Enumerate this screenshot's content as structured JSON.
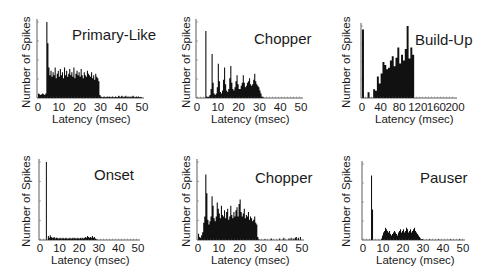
{
  "figure": {
    "ylabel": "Number of Spikes",
    "xlabel": "Latency (msec)"
  },
  "chart_data": [
    {
      "type": "bar",
      "title": "Primary-Like",
      "xlabel": "Latency (msec)",
      "ylabel": "Number of Spikes",
      "xlim": [
        0,
        50
      ],
      "xticks": [
        "0",
        "10",
        "20",
        "30",
        "40",
        "50"
      ],
      "bin_ms": 0.5,
      "description": "Sharp onset peak at ~4 ms followed by sustained irregular activity until ~29 ms, near-zero after",
      "values": [
        6,
        5,
        4,
        5,
        6,
        5,
        4,
        6,
        100,
        72,
        40,
        30,
        36,
        28,
        34,
        30,
        40,
        26,
        32,
        36,
        28,
        38,
        30,
        34,
        26,
        40,
        30,
        36,
        28,
        32,
        38,
        30,
        34,
        28,
        40,
        26,
        32,
        36,
        30,
        34,
        28,
        38,
        30,
        26,
        34,
        30,
        28,
        36,
        32,
        30,
        28,
        34,
        26,
        30,
        24,
        32,
        28,
        26,
        22,
        4,
        2,
        1,
        1,
        2,
        1,
        1,
        2,
        1,
        2,
        1,
        1,
        2,
        1,
        1,
        2,
        1,
        1,
        3,
        2,
        1,
        3,
        2,
        1,
        2,
        3,
        1,
        2,
        1,
        2,
        1,
        2,
        3,
        1,
        1,
        2,
        1,
        2,
        1,
        1,
        1
      ]
    },
    {
      "type": "bar",
      "title": "Chopper",
      "xlabel": "Latency (msec)",
      "ylabel": "Number of Spikes",
      "xlim": [
        0,
        50
      ],
      "xticks": [
        "0",
        "10",
        "20",
        "30",
        "40",
        "50"
      ],
      "bin_ms": 0.5,
      "description": "Regularly spaced damped peaks (chopping) at ~4, 7, 10, 13, 16, 19, 22, 25, 28 ms; activity ends ~31 ms",
      "values": [
        0,
        0,
        0,
        0,
        0,
        0,
        0,
        0,
        88,
        2,
        1,
        2,
        4,
        12,
        58,
        20,
        6,
        4,
        6,
        14,
        45,
        22,
        8,
        6,
        10,
        24,
        40,
        18,
        10,
        8,
        12,
        26,
        42,
        20,
        12,
        10,
        14,
        22,
        30,
        18,
        12,
        12,
        16,
        20,
        30,
        20,
        14,
        16,
        20,
        22,
        26,
        18,
        16,
        18,
        24,
        32,
        22,
        18,
        16,
        14,
        10,
        6,
        2,
        1,
        0,
        0,
        0,
        0,
        0,
        0,
        0,
        0,
        0,
        0,
        0,
        0,
        0,
        0,
        0,
        0,
        0,
        0,
        0,
        0,
        0,
        0,
        0,
        0,
        0,
        0,
        0,
        0,
        0,
        0,
        0,
        0,
        0,
        0,
        0,
        0
      ]
    },
    {
      "type": "bar",
      "title": "Build-Up",
      "xlabel": "Latency (msec)",
      "ylabel": "Number of Spikes",
      "xlim": [
        0,
        200
      ],
      "xticks": [
        "0",
        "40",
        "80",
        "120",
        "160",
        "200"
      ],
      "bin_ms": 4,
      "description": "Small onset spike near 0 ms, activity builds from ~25 ms to peak ~75-100 ms, ends abruptly ~108 ms",
      "values": [
        95,
        0,
        0,
        8,
        0,
        0,
        12,
        10,
        30,
        20,
        34,
        50,
        46,
        40,
        42,
        52,
        58,
        44,
        56,
        70,
        48,
        60,
        52,
        68,
        100,
        55,
        70,
        60,
        0,
        0,
        0,
        0,
        0,
        0,
        0,
        0,
        0,
        0,
        0,
        0,
        0,
        0,
        0,
        0,
        0,
        0,
        0,
        0,
        0,
        0
      ]
    },
    {
      "type": "bar",
      "title": "Onset",
      "xlabel": "Latency (msec)",
      "ylabel": "Number of Spikes",
      "xlim": [
        0,
        50
      ],
      "xticks": [
        "0",
        "10",
        "20",
        "30",
        "40",
        "50"
      ],
      "bin_ms": 0.5,
      "description": "Single sharp onset peak at ~3 ms, then very low sustained activity until ~28 ms",
      "values": [
        0,
        0,
        0,
        0,
        0,
        0,
        100,
        0,
        5,
        3,
        6,
        4,
        3,
        3,
        4,
        2,
        3,
        3,
        2,
        2,
        3,
        2,
        2,
        3,
        2,
        2,
        3,
        2,
        2,
        2,
        3,
        2,
        2,
        3,
        2,
        3,
        2,
        2,
        3,
        2,
        2,
        3,
        2,
        3,
        2,
        3,
        4,
        3,
        5,
        4,
        3,
        4,
        3,
        5,
        3,
        4,
        2,
        1,
        0,
        0,
        0,
        0,
        0,
        0,
        0,
        0,
        0,
        0,
        0,
        0,
        0,
        0,
        0,
        0,
        0,
        0,
        0,
        0,
        0,
        0,
        0,
        0,
        0,
        0,
        0,
        0,
        0,
        0,
        0,
        0,
        0,
        0,
        0,
        0,
        0,
        0,
        0,
        0,
        0,
        0
      ]
    },
    {
      "type": "bar",
      "title": "Chopper",
      "xlabel": "Latency (msec)",
      "ylabel": "Number of Spikes",
      "xlim": [
        0,
        50
      ],
      "xticks": [
        "0",
        "10",
        "20",
        "30",
        "40",
        "50"
      ],
      "bin_ms": 0.5,
      "description": "Irregular chopper: peaks at ~4 and ~8 ms, sustained fluctuating activity to ~28 ms, sparse spikes afterwards",
      "values": [
        8,
        4,
        3,
        6,
        10,
        22,
        30,
        84,
        60,
        26,
        20,
        24,
        30,
        56,
        44,
        28,
        24,
        30,
        48,
        40,
        34,
        28,
        44,
        32,
        30,
        38,
        28,
        36,
        40,
        26,
        30,
        44,
        32,
        28,
        36,
        30,
        38,
        42,
        30,
        46,
        52,
        36,
        30,
        34,
        40,
        28,
        32,
        30,
        36,
        26,
        30,
        28,
        24,
        26,
        30,
        22,
        20,
        4,
        1,
        0,
        0,
        0,
        0,
        0,
        1,
        0,
        0,
        0,
        0,
        0,
        2,
        0,
        0,
        0,
        0,
        0,
        0,
        0,
        2,
        0,
        0,
        0,
        3,
        0,
        0,
        0,
        0,
        2,
        0,
        3,
        0,
        2,
        0,
        3,
        4,
        0,
        3,
        0,
        4,
        0
      ]
    },
    {
      "type": "bar",
      "title": "Pauser",
      "xlabel": "Latency (msec)",
      "ylabel": "Number of Spikes",
      "xlim": [
        0,
        50
      ],
      "xticks": [
        "0",
        "10",
        "20",
        "30",
        "40",
        "50"
      ],
      "bin_ms": 0.5,
      "description": "Sharp onset peak ~4 ms, pause of ~5 ms with no firing, then low sustained activity from ~9 to ~30 ms",
      "values": [
        0,
        0,
        0,
        0,
        0,
        0,
        0,
        0,
        85,
        40,
        0,
        0,
        0,
        0,
        0,
        0,
        0,
        0,
        2,
        6,
        10,
        12,
        16,
        14,
        12,
        10,
        12,
        8,
        6,
        8,
        10,
        12,
        10,
        8,
        6,
        10,
        12,
        14,
        10,
        12,
        14,
        10,
        12,
        16,
        14,
        10,
        12,
        14,
        10,
        12,
        14,
        16,
        12,
        10,
        8,
        6,
        4,
        2,
        1,
        1,
        0,
        0,
        0,
        0,
        0,
        0,
        1,
        0,
        0,
        0,
        0,
        0,
        0,
        0,
        0,
        1,
        0,
        0,
        0,
        0,
        0,
        0,
        0,
        0,
        0,
        0,
        0,
        1,
        0,
        0,
        0,
        0,
        0,
        0,
        0,
        0,
        1,
        0,
        0,
        0
      ]
    }
  ]
}
